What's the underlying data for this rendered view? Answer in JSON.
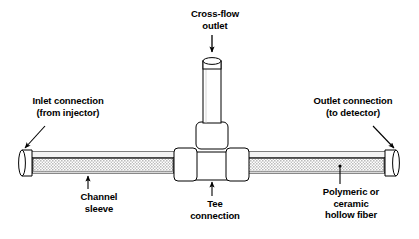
{
  "figure": {
    "width": 419,
    "height": 239,
    "background_color": "#ffffff",
    "line_color": "#000000",
    "fiber_fill_color": "#b8b8b8",
    "sleeve_fill_color": "#f2f2f2"
  },
  "labels": {
    "cross_flow_outlet": {
      "line1": "Cross-flow",
      "line2": "outlet"
    },
    "inlet_connection": {
      "line1": "Inlet connection",
      "line2": "(from injector)"
    },
    "outlet_connection": {
      "line1": "Outlet connection",
      "line2": "(to detector)"
    },
    "channel_sleeve": {
      "line1": "Channel",
      "line2": "sleeve"
    },
    "tee_connection": {
      "line1": "Tee",
      "line2": "connection"
    },
    "hollow_fiber": {
      "line1": "Polymeric or",
      "line2": "ceramic",
      "line3": "hollow fiber"
    }
  },
  "parts": [
    {
      "name": "inlet-end-fitting",
      "description": "open cylindrical ferrule at left end"
    },
    {
      "name": "outlet-end-fitting",
      "description": "open cylindrical ferrule at right end"
    },
    {
      "name": "channel-sleeve",
      "description": "horizontal outer sleeve tube"
    },
    {
      "name": "hollow-fiber",
      "description": "speckled polymeric or ceramic hollow fiber inside sleeve"
    },
    {
      "name": "tee-connection",
      "description": "tee union body joining inlet, outlet and cross-flow ports"
    },
    {
      "name": "tee-left-nut",
      "description": "left compression nut of tee"
    },
    {
      "name": "tee-right-nut",
      "description": "right compression nut of tee"
    },
    {
      "name": "tee-top-nut",
      "description": "upper compression nut of tee"
    },
    {
      "name": "cross-flow-outlet-tube",
      "description": "vertical open tube for cross-flow outlet"
    }
  ]
}
